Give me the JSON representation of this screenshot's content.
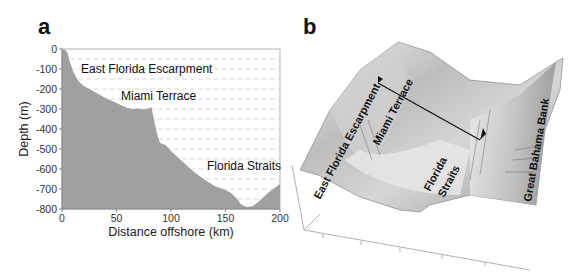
{
  "figure": {
    "panel_a_label": "a",
    "panel_b_label": "b"
  },
  "chart_data": [
    {
      "panel": "a",
      "type": "area",
      "title": "",
      "xlabel": "Distance offshore (km)",
      "ylabel": "Depth (m)",
      "xlim": [
        0,
        200
      ],
      "ylim": [
        -800,
        0
      ],
      "xticks": [
        0,
        50,
        100,
        150,
        200
      ],
      "yticks": [
        0,
        -100,
        -200,
        -300,
        -400,
        -500,
        -600,
        -700,
        -800
      ],
      "grid": "horizontal dashed every 50 m",
      "fill_color": "#a0a0a0",
      "x": [
        0,
        3,
        5,
        7,
        10,
        15,
        20,
        30,
        40,
        50,
        60,
        65,
        70,
        75,
        80,
        82,
        85,
        88,
        90,
        95,
        100,
        110,
        120,
        130,
        140,
        150,
        155,
        160,
        165,
        170,
        175,
        180,
        185,
        190,
        195,
        200
      ],
      "values": [
        0,
        -5,
        -20,
        -60,
        -110,
        -160,
        -185,
        -215,
        -245,
        -270,
        -295,
        -300,
        -298,
        -302,
        -296,
        -290,
        -370,
        -440,
        -470,
        -480,
        -510,
        -560,
        -610,
        -650,
        -685,
        -705,
        -720,
        -745,
        -780,
        -790,
        -785,
        -765,
        -740,
        -715,
        -695,
        -675
      ],
      "annotations": [
        {
          "text": "East Florida Escarpment",
          "x": 14,
          "y": -90
        },
        {
          "text": "Miami Terrace",
          "x": 55,
          "y": -230
        },
        {
          "text": "Florida Straits",
          "x": 133,
          "y": -610
        }
      ]
    },
    {
      "panel": "b",
      "type": "surface",
      "title": "",
      "description": "3D shaded-relief bathymetry of the Florida Straits with profile transect line",
      "annotations": [
        {
          "text": "East Florida Escarpment"
        },
        {
          "text": "Miami Terrace"
        },
        {
          "text": "Florida Straits"
        },
        {
          "text": "Great Bahama Bank"
        }
      ]
    }
  ]
}
